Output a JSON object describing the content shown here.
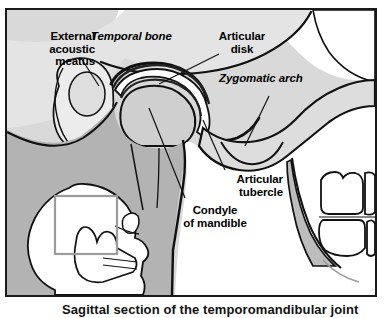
{
  "figure": {
    "type": "anatomical-illustration",
    "background_color": "#d9d9d9",
    "frame_color": "#1a1a1a",
    "bone_fill_color": "#e8e8e8",
    "shadow_fill_color": "#b0b0b0",
    "disk_fill_color": "#ffffff",
    "outline_color": "#111111"
  },
  "labels": [
    {
      "id": "external-acoustic-meatus",
      "text": "External\nacoustic\nmeatus",
      "style": "regular",
      "align": "right"
    },
    {
      "id": "temporal-bone",
      "text": "Temporal bone",
      "style": "italic",
      "align": "left"
    },
    {
      "id": "articular-disk",
      "text": "Articular\ndisk",
      "style": "regular",
      "align": "center"
    },
    {
      "id": "zygomatic-arch",
      "text": "Zygomatic arch",
      "style": "italic",
      "align": "left"
    },
    {
      "id": "articular-tubercle",
      "text": "Articular\ntubercle",
      "style": "regular",
      "align": "right"
    },
    {
      "id": "condyle-of-mandible",
      "text": "Condyle\nof mandible",
      "style": "regular",
      "align": "center"
    }
  ],
  "inset": {
    "name": "skull-orientation-inset",
    "description": "Lateral skull profile facing right with a rectangle outlining the magnified temporomandibular joint region",
    "highlight_box": true
  },
  "caption": {
    "text": "Sagittal section of the temporomandibular joint",
    "clipped": true
  }
}
